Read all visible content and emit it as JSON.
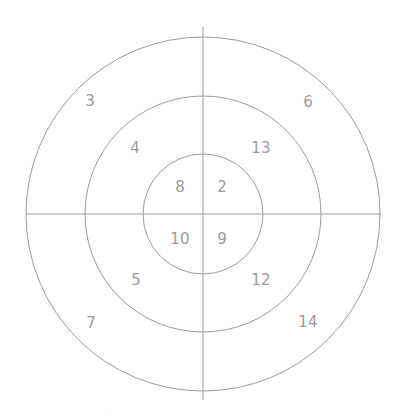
{
  "canvas": {
    "width": 401,
    "height": 420,
    "background": "#ffffff"
  },
  "style": {
    "stroke_color": "#9b9b9b",
    "stroke_width": 1,
    "label_color": "#9b9b9b",
    "label_font_size": 15
  },
  "chart_data": {
    "type": "diagram",
    "subtype": "concentric-circles-quadrants",
    "title": "",
    "center": {
      "x": 203,
      "y": 214
    },
    "rings": [
      {
        "name": "inner",
        "radius": 60
      },
      {
        "name": "middle",
        "radius": 118
      },
      {
        "name": "outer",
        "radius": 177
      }
    ],
    "dividers": [
      {
        "name": "vertical-divider",
        "x1": 203,
        "y1": 27,
        "x2": 203,
        "y2": 400
      },
      {
        "name": "horizontal-divider",
        "x1": 26,
        "y1": 214,
        "x2": 381,
        "y2": 214
      }
    ],
    "labels": [
      {
        "value": "3",
        "ring": "outer",
        "quadrant": "top-left",
        "x": 90,
        "y": 101
      },
      {
        "value": "6",
        "ring": "outer",
        "quadrant": "top-right",
        "x": 308,
        "y": 102
      },
      {
        "value": "7",
        "ring": "outer",
        "quadrant": "bottom-left",
        "x": 91,
        "y": 323
      },
      {
        "value": "14",
        "ring": "outer",
        "quadrant": "bottom-right",
        "x": 308,
        "y": 322
      },
      {
        "value": "4",
        "ring": "middle",
        "quadrant": "top-left",
        "x": 135,
        "y": 148
      },
      {
        "value": "13",
        "ring": "middle",
        "quadrant": "top-right",
        "x": 261,
        "y": 148
      },
      {
        "value": "5",
        "ring": "middle",
        "quadrant": "bottom-left",
        "x": 136,
        "y": 280
      },
      {
        "value": "12",
        "ring": "middle",
        "quadrant": "bottom-right",
        "x": 261,
        "y": 280
      },
      {
        "value": "8",
        "ring": "inner",
        "quadrant": "top-left",
        "x": 180,
        "y": 187
      },
      {
        "value": "2",
        "ring": "inner",
        "quadrant": "top-right",
        "x": 222,
        "y": 187
      },
      {
        "value": "10",
        "ring": "inner",
        "quadrant": "bottom-left",
        "x": 180,
        "y": 239
      },
      {
        "value": "9",
        "ring": "inner",
        "quadrant": "bottom-right",
        "x": 222,
        "y": 239
      }
    ],
    "artifact": {
      "value": "·",
      "x": 110,
      "y": 411
    }
  }
}
